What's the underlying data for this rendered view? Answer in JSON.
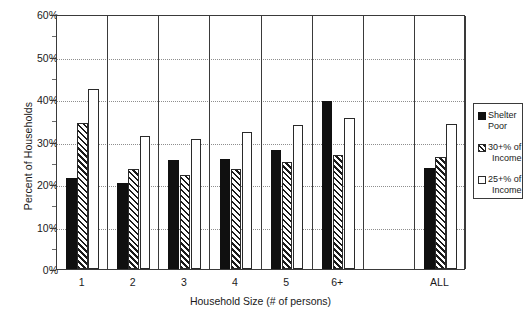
{
  "chart_data": {
    "type": "bar",
    "title": "",
    "xlabel": "Household Size (# of persons)",
    "ylabel": "Percent of Households",
    "ylim": [
      0,
      60
    ],
    "ytick_values": [
      0,
      10,
      20,
      30,
      40,
      50,
      60
    ],
    "ytick_labels": [
      "0%",
      "10%",
      "20%",
      "30%",
      "40%",
      "50%",
      "60%"
    ],
    "grid": "horizontal-dotted",
    "legend_position": "right-outside",
    "categories": [
      "1",
      "2",
      "3",
      "4",
      "5",
      "6+",
      "ALL"
    ],
    "series": [
      {
        "name": "Shelter Poor",
        "fill": "solid-black",
        "color": "#101010",
        "values": [
          21.3,
          20.3,
          25.7,
          25.9,
          27.9,
          39.5,
          23.8
        ]
      },
      {
        "name": "30+% of Income",
        "fill": "diagonal-hatch",
        "color": "#1b1b1b",
        "values": [
          34.3,
          23.6,
          22.1,
          23.5,
          25.2,
          26.9,
          26.4
        ]
      },
      {
        "name": "25+% of Income",
        "fill": "open-white",
        "color": "#ffffff",
        "values": [
          42.4,
          31.3,
          30.5,
          32.3,
          33.8,
          35.5,
          34.2
        ]
      }
    ]
  },
  "legend": {
    "items": [
      {
        "label_line1": "Shelter Poor",
        "label_line2": "",
        "fill": "solid"
      },
      {
        "label_line1": "30+% of",
        "label_line2": "Income",
        "fill": "hatch"
      },
      {
        "label_line1": "25+% of",
        "label_line2": "Income",
        "fill": "open"
      }
    ]
  }
}
